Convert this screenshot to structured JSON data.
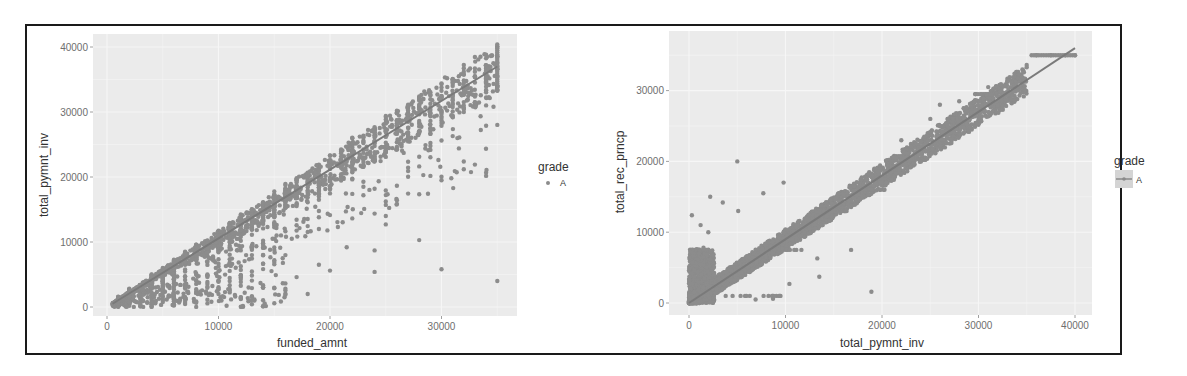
{
  "chart_data": [
    {
      "type": "scatter",
      "panel": "left",
      "title": "",
      "xlabel": "funded_amnt",
      "ylabel": "total_pymnt_inv",
      "xlim": [
        -2000,
        37000
      ],
      "ylim": [
        -1800,
        41000
      ],
      "xticks": [
        0,
        10000,
        20000,
        30000
      ],
      "yticks": [
        0,
        10000,
        20000,
        30000,
        40000
      ],
      "grid": true,
      "legend": {
        "title": "grade",
        "entries": [
          "A"
        ],
        "glyph": "point",
        "position": "right"
      },
      "fit_line": {
        "x": [
          500,
          35000
        ],
        "y": [
          500,
          37000
        ]
      },
      "series": [
        {
          "name": "A",
          "dense_band": {
            "x_from": 500,
            "x_to": 35000,
            "upper_ratio": 1.12,
            "lower_ratio": 0.0
          },
          "points": [
            {
              "x": 30000,
              "y": 19500
            },
            {
              "x": 23000,
              "y": 17200
            },
            {
              "x": 25000,
              "y": 14000
            },
            {
              "x": 25000,
              "y": 12700
            },
            {
              "x": 28000,
              "y": 10300
            },
            {
              "x": 21500,
              "y": 9200
            },
            {
              "x": 24000,
              "y": 8700
            },
            {
              "x": 20000,
              "y": 5600
            },
            {
              "x": 24000,
              "y": 5400
            },
            {
              "x": 30000,
              "y": 5800
            },
            {
              "x": 35000,
              "y": 4000
            },
            {
              "x": 18000,
              "y": 2000
            },
            {
              "x": 16000,
              "y": 2800
            },
            {
              "x": 19000,
              "y": 6500
            },
            {
              "x": 17000,
              "y": 4600
            },
            {
              "x": 35000,
              "y": 34000
            },
            {
              "x": 35000,
              "y": 35500
            },
            {
              "x": 35000,
              "y": 37000
            },
            {
              "x": 35000,
              "y": 38500
            },
            {
              "x": 35000,
              "y": 40000
            },
            {
              "x": 33500,
              "y": 38500
            }
          ]
        }
      ]
    },
    {
      "type": "scatter",
      "panel": "right",
      "title": "",
      "xlabel": "total_pymnt_inv",
      "ylabel": "total_rec_prncp",
      "xlim": [
        -2000,
        42000
      ],
      "ylim": [
        -1700,
        38500
      ],
      "xticks": [
        0,
        10000,
        20000,
        30000,
        40000
      ],
      "yticks": [
        0,
        10000,
        20000,
        30000
      ],
      "grid": true,
      "legend": {
        "title": "grade",
        "entries": [
          "A"
        ],
        "glyph": "line-with-band",
        "position": "right"
      },
      "fit_line": {
        "x": [
          0,
          40000
        ],
        "y": [
          0,
          36000
        ]
      },
      "series": [
        {
          "name": "A",
          "dense_band": {
            "x_from": 0,
            "x_to": 35000,
            "note": "tight diagonal band, plus block 0-2500 x 0-7500"
          },
          "points": [
            {
              "x": 5000,
              "y": 20000
            },
            {
              "x": 2200,
              "y": 15000
            },
            {
              "x": 9800,
              "y": 17000
            },
            {
              "x": 7700,
              "y": 15500
            },
            {
              "x": 300,
              "y": 12400
            },
            {
              "x": 1200,
              "y": 11000
            },
            {
              "x": 3500,
              "y": 14200
            },
            {
              "x": 5100,
              "y": 13000
            },
            {
              "x": 13300,
              "y": 6300
            },
            {
              "x": 13500,
              "y": 3700
            },
            {
              "x": 16800,
              "y": 7500
            },
            {
              "x": 18900,
              "y": 1600
            },
            {
              "x": 10400,
              "y": 2700
            },
            {
              "x": 6900,
              "y": 500
            },
            {
              "x": 8700,
              "y": 600
            },
            {
              "x": 3800,
              "y": 1000
            },
            {
              "x": 1500,
              "y": 7800
            },
            {
              "x": 2000,
              "y": 10000
            },
            {
              "x": 26000,
              "y": 28000
            },
            {
              "x": 25000,
              "y": 26000
            },
            {
              "x": 22000,
              "y": 23000
            },
            {
              "x": 28000,
              "y": 28500
            },
            {
              "x": 31000,
              "y": 30500
            },
            {
              "x": 36000,
              "y": 35000
            },
            {
              "x": 37500,
              "y": 35000
            },
            {
              "x": 39000,
              "y": 35000
            },
            {
              "x": 40000,
              "y": 35000
            }
          ]
        }
      ]
    }
  ],
  "panels": {
    "left": {
      "xlabel": "funded_amnt",
      "ylabel": "total_pymnt_inv",
      "xticks": [
        "0",
        "10000",
        "20000",
        "30000"
      ],
      "yticks": [
        "0",
        "10000",
        "20000",
        "30000",
        "40000"
      ],
      "legend_title": "grade",
      "legend_entry": "A"
    },
    "right": {
      "xlabel": "total_pymnt_inv",
      "ylabel": "total_rec_prncp",
      "xticks": [
        "0",
        "10000",
        "20000",
        "30000",
        "40000"
      ],
      "yticks": [
        "0",
        "10000",
        "20000",
        "30000"
      ],
      "legend_title": "grade",
      "legend_entry": "A"
    }
  },
  "colors": {
    "panel_bg": "#ebebeb",
    "grid": "#f6f6f6",
    "point": "#8c8c8c",
    "line": "#7a7a7a",
    "frame": "#1a1a1a"
  }
}
